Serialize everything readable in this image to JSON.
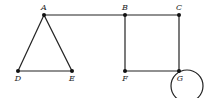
{
  "diagram": {
    "type": "graph",
    "nodes": [
      {
        "id": "A",
        "label": "A",
        "x": 44,
        "y": 15,
        "lx": 44,
        "ly": 10
      },
      {
        "id": "B",
        "label": "B",
        "x": 125,
        "y": 15,
        "lx": 125,
        "ly": 10
      },
      {
        "id": "C",
        "label": "C",
        "x": 179,
        "y": 15,
        "lx": 179,
        "ly": 10
      },
      {
        "id": "D",
        "label": "D",
        "x": 18,
        "y": 71,
        "lx": 18,
        "ly": 81
      },
      {
        "id": "E",
        "label": "E",
        "x": 72,
        "y": 71,
        "lx": 72,
        "ly": 81
      },
      {
        "id": "F",
        "label": "F",
        "x": 125,
        "y": 71,
        "lx": 125,
        "ly": 81
      },
      {
        "id": "G",
        "label": "G",
        "x": 179,
        "y": 71,
        "lx": 180,
        "ly": 81
      }
    ],
    "edges": [
      [
        "A",
        "D"
      ],
      [
        "A",
        "E"
      ],
      [
        "D",
        "E"
      ],
      [
        "A",
        "B"
      ],
      [
        "B",
        "C"
      ],
      [
        "B",
        "F"
      ],
      [
        "C",
        "G"
      ],
      [
        "F",
        "G"
      ]
    ],
    "loops": [
      {
        "node": "G",
        "cx": 187,
        "cy": 86,
        "r": 16
      }
    ],
    "colors": {
      "stroke": "#222222",
      "point": "#111111",
      "background": "#ffffff"
    }
  }
}
